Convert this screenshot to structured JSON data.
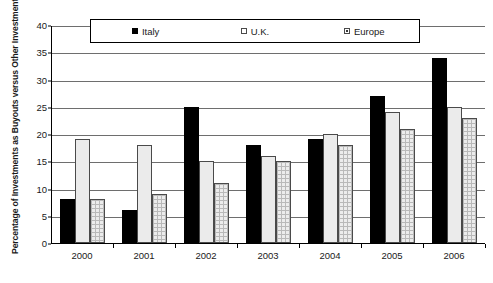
{
  "chart_data": {
    "type": "bar",
    "title": "",
    "xlabel": "",
    "ylabel": "Percentage of Investments as Buyouts versus Other Investment Stages",
    "categories": [
      "2000",
      "2001",
      "2002",
      "2003",
      "2004",
      "2005",
      "2006"
    ],
    "series": [
      {
        "name": "Italy",
        "color": "#000000",
        "values": [
          8,
          6,
          25,
          18,
          19,
          27,
          34
        ]
      },
      {
        "name": "U.K.",
        "color": "#ebebeb",
        "values": [
          19,
          18,
          15,
          16,
          20,
          24,
          25
        ]
      },
      {
        "name": "Europe",
        "color": "#ececec",
        "values": [
          8,
          9,
          11,
          15,
          18,
          21,
          23
        ]
      }
    ],
    "ylim": [
      0,
      40
    ],
    "ytick_step": 5,
    "yticks": [
      "40",
      "35",
      "30",
      "25",
      "20",
      "15",
      "10",
      "5",
      "0"
    ],
    "grid": true,
    "legend_position": "top-inside"
  },
  "legend": {
    "items": [
      {
        "label": "Italy",
        "marker": "filled-square-icon"
      },
      {
        "label": "U.K.",
        "marker": "empty-square-icon"
      },
      {
        "label": "Europe",
        "marker": "dotted-square-icon"
      }
    ]
  },
  "caption": {
    "text": ""
  }
}
